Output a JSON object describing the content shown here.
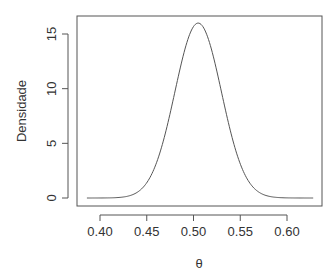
{
  "chart_data": {
    "type": "line",
    "title": "",
    "xlabel": "θ",
    "ylabel": "Densidade",
    "xlim": [
      0.38,
      0.635
    ],
    "ylim": [
      -0.5,
      16.5
    ],
    "xticks": [
      0.4,
      0.45,
      0.5,
      0.55,
      0.6
    ],
    "xtick_labels": [
      "0.40",
      "0.45",
      "0.50",
      "0.55",
      "0.60"
    ],
    "yticks": [
      0,
      5,
      10,
      15
    ],
    "ytick_labels": [
      "0",
      "5",
      "10",
      "15"
    ],
    "grid": false,
    "legend": null,
    "series": [
      {
        "name": "density",
        "distribution_hint": "approximately normal, mean 0.505, sd 0.025",
        "x": [
          0.386,
          0.4,
          0.42,
          0.44,
          0.45,
          0.46,
          0.47,
          0.48,
          0.49,
          0.5,
          0.505,
          0.51,
          0.52,
          0.53,
          0.54,
          0.55,
          0.56,
          0.57,
          0.58,
          0.6,
          0.628
        ],
        "y": [
          0.0,
          0.02,
          0.1,
          0.7,
          1.8,
          3.2,
          5.6,
          8.1,
          11.6,
          15.3,
          16.0,
          15.6,
          13.0,
          9.2,
          5.8,
          3.0,
          1.3,
          0.5,
          0.15,
          0.01,
          0.0
        ]
      }
    ]
  }
}
